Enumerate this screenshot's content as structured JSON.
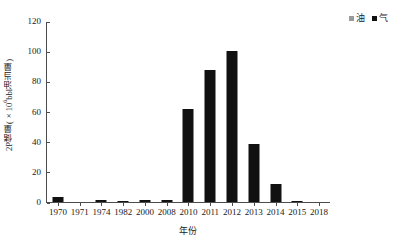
{
  "chart_data": {
    "type": "bar",
    "title": "",
    "xlabel": "年份",
    "ylabel": "2P储量(×10⁶bbl油当量)",
    "ylabel_parts": {
      "prefix": "2P储量(×10",
      "exponent": "6",
      "suffix": "bbl油当量)"
    },
    "categories": [
      "1970",
      "1971",
      "1974",
      "1982",
      "2000",
      "2008",
      "2010",
      "2011",
      "2012",
      "2013",
      "2014",
      "2015",
      "2018"
    ],
    "values": [
      3.2,
      0.0,
      1.6,
      0.8,
      1.6,
      1.5,
      62.0,
      88.0,
      101.0,
      39.0,
      12.0,
      1.0,
      0.0
    ],
    "series": [
      {
        "name": "气",
        "color": "#111111",
        "values": [
          3.2,
          0.0,
          1.6,
          0.8,
          1.6,
          1.5,
          62.0,
          88.0,
          101.0,
          39.0,
          12.0,
          1.0,
          0.0
        ]
      }
    ],
    "ylim": [
      0,
      120
    ],
    "yticks": [
      0,
      20,
      40,
      60,
      80,
      100,
      120
    ],
    "ytick_labels": [
      "0",
      "20",
      "40",
      "60",
      "80",
      "100",
      "120"
    ],
    "grid": false,
    "legend_position": "top-right"
  },
  "legend": {
    "entries": [
      {
        "label": "油",
        "color": "#9a9a9a",
        "name": "oil"
      },
      {
        "label": "气",
        "color": "#111111",
        "name": "gas"
      }
    ]
  },
  "axes": {
    "y_title": "2P储量(×10⁶bbl油当量)",
    "x_title": "年份"
  }
}
